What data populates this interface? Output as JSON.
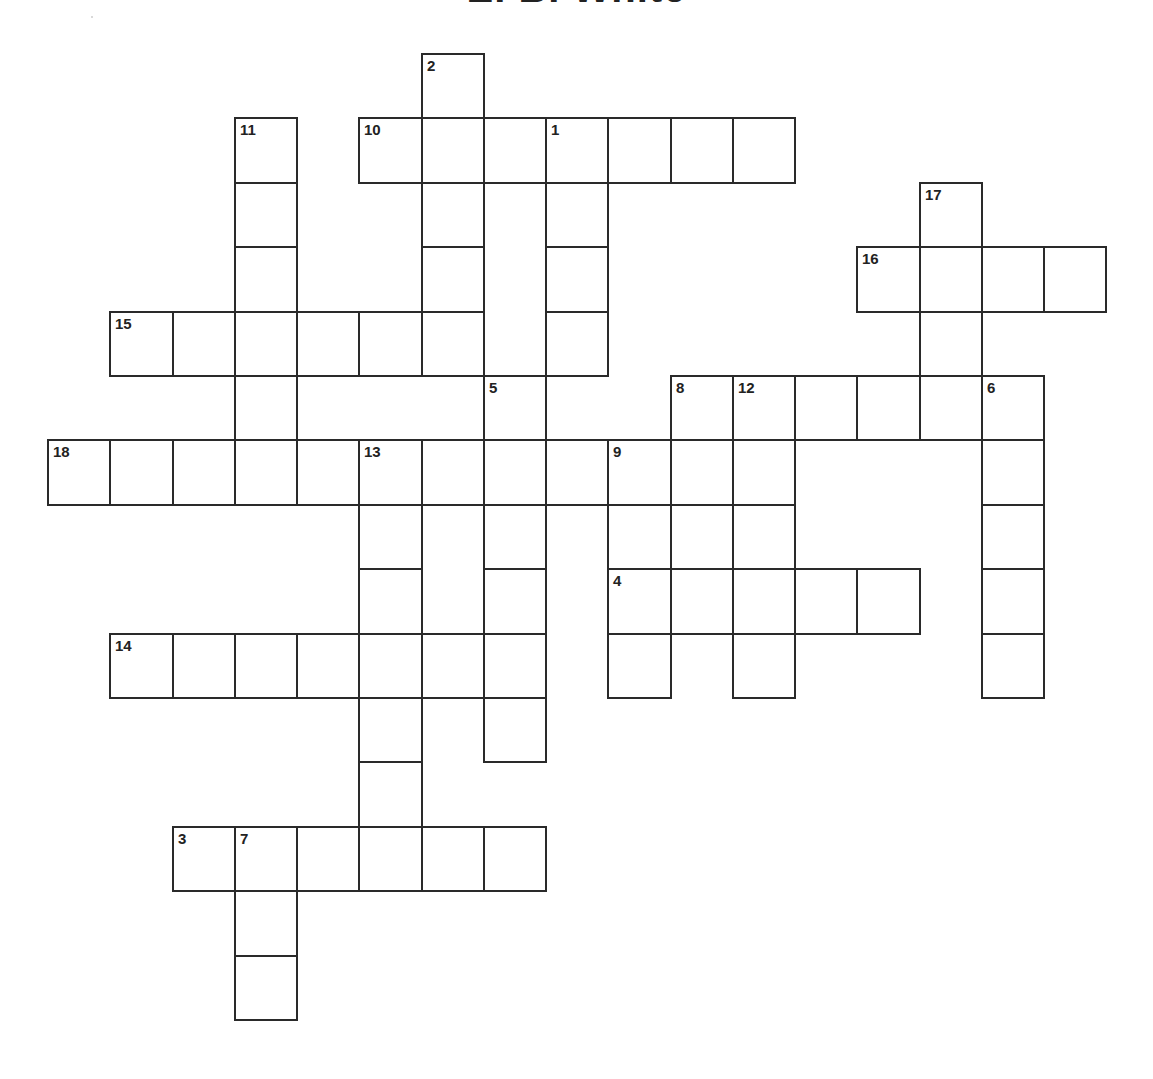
{
  "puzzle": {
    "title": "E. B. White",
    "grid_origin": {
      "x": 48,
      "y": 54
    },
    "cell_size": {
      "w": 62.25,
      "h": 64.4
    },
    "line_color": "#2a2a2a",
    "numbers": [
      {
        "n": "2",
        "c": 6,
        "r": 0
      },
      {
        "n": "11",
        "c": 3,
        "r": 1
      },
      {
        "n": "10",
        "c": 5,
        "r": 1
      },
      {
        "n": "1",
        "c": 8,
        "r": 1
      },
      {
        "n": "17",
        "c": 14,
        "r": 2
      },
      {
        "n": "16",
        "c": 13,
        "r": 3
      },
      {
        "n": "15",
        "c": 1,
        "r": 4
      },
      {
        "n": "5",
        "c": 7,
        "r": 5
      },
      {
        "n": "8",
        "c": 10,
        "r": 5
      },
      {
        "n": "12",
        "c": 11,
        "r": 5
      },
      {
        "n": "6",
        "c": 15,
        "r": 5
      },
      {
        "n": "18",
        "c": 0,
        "r": 6
      },
      {
        "n": "13",
        "c": 5,
        "r": 6
      },
      {
        "n": "9",
        "c": 9,
        "r": 6
      },
      {
        "n": "4",
        "c": 9,
        "r": 8
      },
      {
        "n": "14",
        "c": 1,
        "r": 9
      },
      {
        "n": "3",
        "c": 2,
        "r": 12
      },
      {
        "n": "7",
        "c": 3,
        "r": 12
      }
    ],
    "entries": [
      {
        "id": "1-down",
        "n": "1",
        "dir": "down",
        "c": 8,
        "r": 1,
        "len": 4
      },
      {
        "id": "2-down",
        "n": "2",
        "dir": "down",
        "c": 6,
        "r": 0,
        "len": 5
      },
      {
        "id": "3-across",
        "n": "3",
        "dir": "across",
        "c": 2,
        "r": 12,
        "len": 6
      },
      {
        "id": "4-across",
        "n": "4",
        "dir": "across",
        "c": 9,
        "r": 8,
        "len": 5
      },
      {
        "id": "5-down",
        "n": "5",
        "dir": "down",
        "c": 7,
        "r": 5,
        "len": 6
      },
      {
        "id": "6-down",
        "n": "6",
        "dir": "down",
        "c": 15,
        "r": 5,
        "len": 5
      },
      {
        "id": "7-down",
        "n": "7",
        "dir": "down",
        "c": 3,
        "r": 12,
        "len": 3
      },
      {
        "id": "8-down",
        "n": "8",
        "dir": "down",
        "c": 10,
        "r": 5,
        "len": 4
      },
      {
        "id": "9-down",
        "n": "9",
        "dir": "down",
        "c": 9,
        "r": 6,
        "len": 4
      },
      {
        "id": "10-across",
        "n": "10",
        "dir": "across",
        "c": 5,
        "r": 1,
        "len": 7
      },
      {
        "id": "11-down",
        "n": "11",
        "dir": "down",
        "c": 3,
        "r": 1,
        "len": 6
      },
      {
        "id": "12-across",
        "n": "12",
        "dir": "across",
        "c": 10,
        "r": 5,
        "len": 6
      },
      {
        "id": "12-down",
        "n": "12",
        "dir": "down",
        "c": 11,
        "r": 5,
        "len": 5
      },
      {
        "id": "13-down",
        "n": "13",
        "dir": "down",
        "c": 5,
        "r": 6,
        "len": 7
      },
      {
        "id": "14-across",
        "n": "14",
        "dir": "across",
        "c": 1,
        "r": 9,
        "len": 7
      },
      {
        "id": "15-across",
        "n": "15",
        "dir": "across",
        "c": 1,
        "r": 4,
        "len": 6
      },
      {
        "id": "16-across",
        "n": "16",
        "dir": "across",
        "c": 13,
        "r": 3,
        "len": 4
      },
      {
        "id": "17-down",
        "n": "17",
        "dir": "down",
        "c": 14,
        "r": 2,
        "len": 4
      },
      {
        "id": "18-across",
        "n": "18",
        "dir": "across",
        "c": 0,
        "r": 6,
        "len": 10
      }
    ],
    "missing_borders": [
      {
        "c": 10,
        "r": 6,
        "side": "bottom"
      },
      {
        "c": 10,
        "r": 7,
        "side": "top"
      }
    ]
  }
}
